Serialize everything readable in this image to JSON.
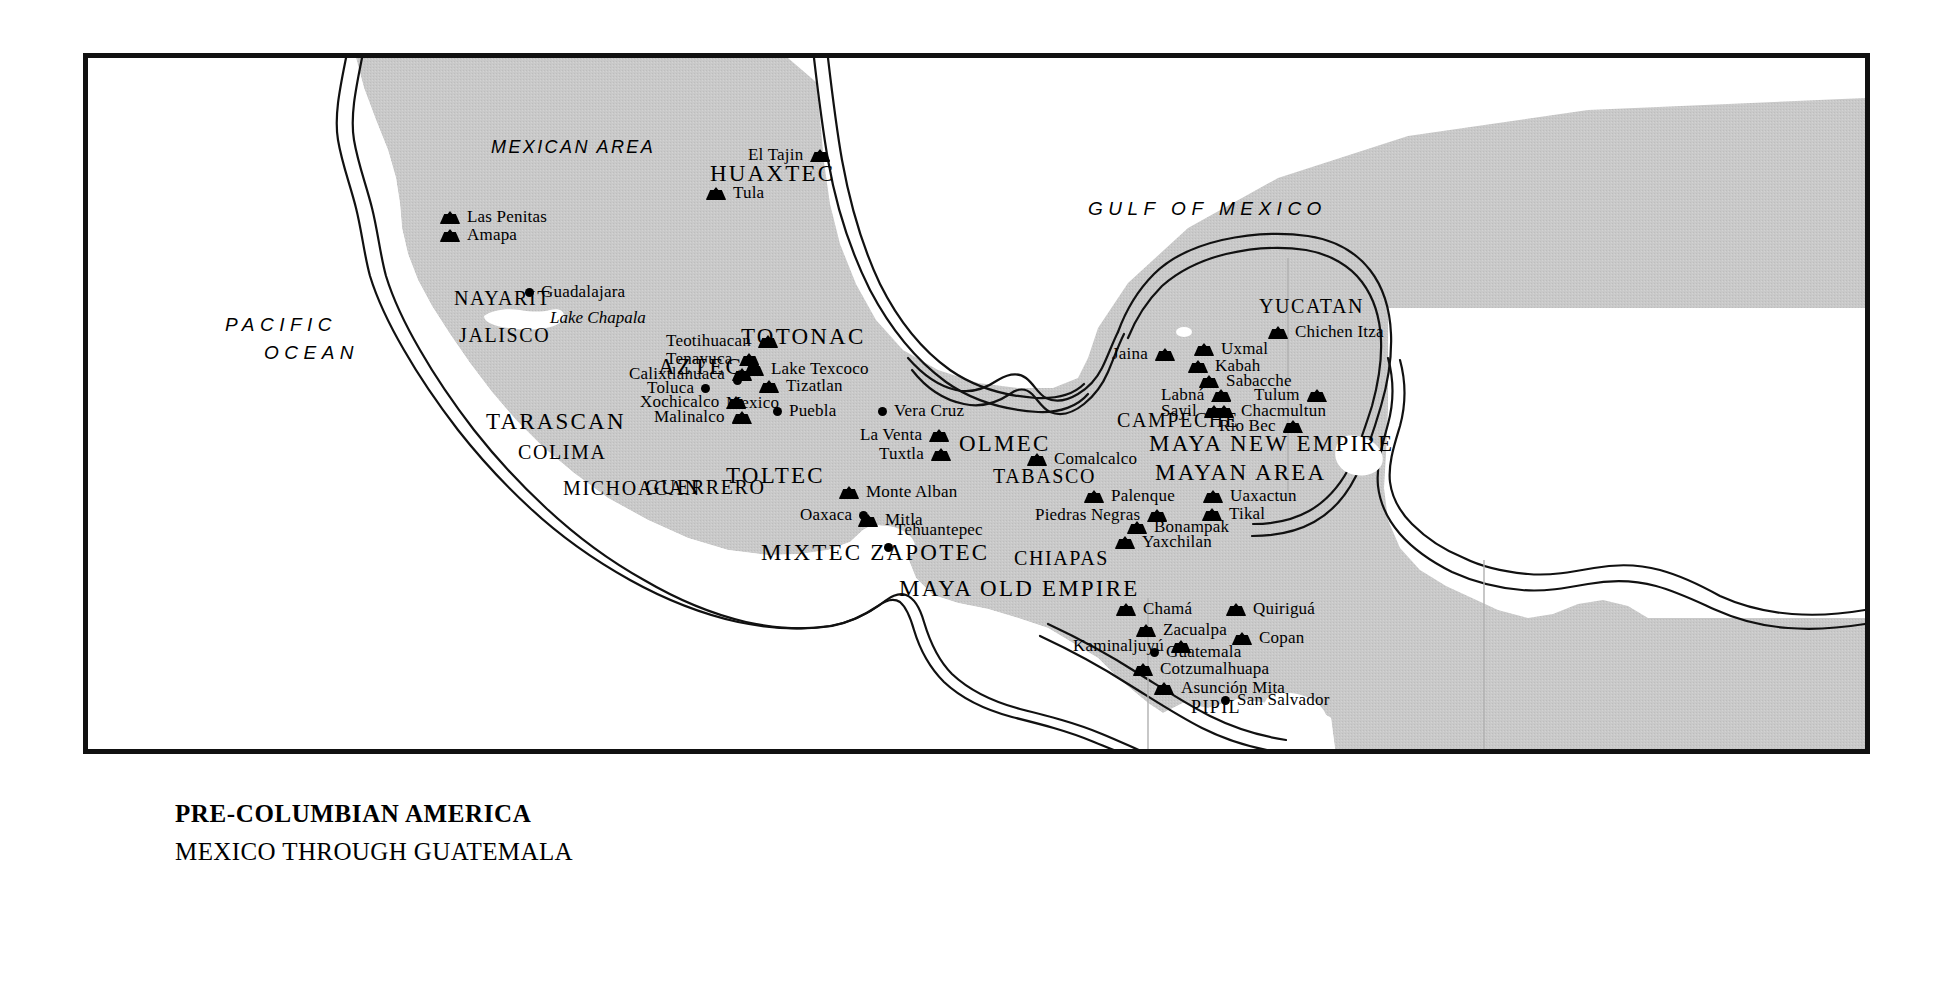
{
  "title": {
    "main": "PRE-COLUMBIAN AMERICA",
    "sub": "MEXICO THROUGH GUATEMALA"
  },
  "colors": {
    "land": "#c9c9c9",
    "water": "#ffffff",
    "ink": "#000000",
    "frame": "#111111"
  },
  "oceans": [
    {
      "name": "PACIFIC",
      "x": 137,
      "y": 257
    },
    {
      "name": "OCEAN",
      "x": 176,
      "y": 285
    },
    {
      "name": "GULF OF MEXICO",
      "x": 1000,
      "y": 141
    }
  ],
  "areas": [
    {
      "name": "MEXICAN AREA",
      "x": 403,
      "y": 80
    }
  ],
  "regions": [
    {
      "name": "HUAXTEC",
      "x": 622,
      "y": 104,
      "size": "lg"
    },
    {
      "name": "NAYARIT",
      "x": 366,
      "y": 230
    },
    {
      "name": "JALISCO",
      "x": 371,
      "y": 267
    },
    {
      "name": "TOTONAC",
      "x": 653,
      "y": 267,
      "size": "lg"
    },
    {
      "name": "AZTEC",
      "x": 570,
      "y": 297,
      "size": "lg"
    },
    {
      "name": "TARASCAN",
      "x": 398,
      "y": 352,
      "size": "lg"
    },
    {
      "name": "COLIMA",
      "x": 430,
      "y": 384
    },
    {
      "name": "TOLTEC",
      "x": 638,
      "y": 406,
      "size": "lg"
    },
    {
      "name": "OLMEC",
      "x": 871,
      "y": 374,
      "size": "lg"
    },
    {
      "name": "MICHOACAN",
      "x": 475,
      "y": 420
    },
    {
      "name": "CAMPECHE",
      "x": 1029,
      "y": 352
    },
    {
      "name": "MAYA NEW EMPIRE",
      "x": 1061,
      "y": 374,
      "size": "lg"
    },
    {
      "name": "YUCATAN",
      "x": 1171,
      "y": 238
    },
    {
      "name": "MAYAN AREA",
      "x": 1067,
      "y": 403,
      "size": "lg"
    },
    {
      "name": "TABASCO",
      "x": 905,
      "y": 408
    },
    {
      "name": "GUERRERO",
      "x": 557,
      "y": 419
    },
    {
      "name": "MIXTEC ZAPOTEC",
      "x": 673,
      "y": 483,
      "size": "lg"
    },
    {
      "name": "CHIAPAS",
      "x": 926,
      "y": 490
    },
    {
      "name": "MAYA OLD EMPIRE",
      "x": 811,
      "y": 519,
      "size": "lg"
    },
    {
      "name": "PIPIL",
      "x": 1103,
      "y": 640
    }
  ],
  "lakes": [
    {
      "name": "Lake Chapala",
      "x": 462,
      "y": 251
    }
  ],
  "sites": [
    {
      "name": "Las Penitas",
      "x": 352,
      "y": 149,
      "marker": "pyramid",
      "side": "right"
    },
    {
      "name": "Amapa",
      "x": 352,
      "y": 167,
      "marker": "pyramid",
      "side": "right"
    },
    {
      "name": "El Tajin",
      "x": 660,
      "y": 87,
      "marker": "pyramid",
      "side": "left"
    },
    {
      "name": "Tula",
      "x": 618,
      "y": 125,
      "marker": "pyramid",
      "side": "right"
    },
    {
      "name": "Guadalajara",
      "x": 437,
      "y": 224,
      "marker": "dot",
      "side": "right"
    },
    {
      "name": "Teotihuacan",
      "x": 578,
      "y": 273,
      "marker": "pyramid",
      "side": "left"
    },
    {
      "name": "Tenayuca",
      "x": 578,
      "y": 291,
      "marker": "pyramid",
      "side": "left"
    },
    {
      "name": "Calixtlahuaca",
      "x": 541,
      "y": 306,
      "marker": "pyramid",
      "side": "left"
    },
    {
      "name": "Lake Texcoco",
      "x": 656,
      "y": 301,
      "marker": "pyramid",
      "side": "right"
    },
    {
      "name": "Toluca",
      "x": 559,
      "y": 320,
      "marker": "dot",
      "side": "left"
    },
    {
      "name": "Tizatlan",
      "x": 671,
      "y": 318,
      "marker": "pyramid",
      "side": "right"
    },
    {
      "name": "Mexico",
      "x": 650,
      "y": 332,
      "marker": "dot-above",
      "side": "none"
    },
    {
      "name": "Xochicalco",
      "x": 552,
      "y": 334,
      "marker": "pyramid",
      "side": "left"
    },
    {
      "name": "Puebla",
      "x": 685,
      "y": 343,
      "marker": "dot",
      "side": "right"
    },
    {
      "name": "Malinalco",
      "x": 566,
      "y": 349,
      "marker": "pyramid",
      "side": "left"
    },
    {
      "name": "Vera Cruz",
      "x": 790,
      "y": 343,
      "marker": "dot",
      "side": "right"
    },
    {
      "name": "La Venta",
      "x": 772,
      "y": 367,
      "marker": "pyramid",
      "side": "left"
    },
    {
      "name": "Tuxtla",
      "x": 791,
      "y": 386,
      "marker": "pyramid",
      "side": "left"
    },
    {
      "name": "Comalcalco",
      "x": 939,
      "y": 391,
      "marker": "pyramid",
      "side": "right"
    },
    {
      "name": "Jaina",
      "x": 1024,
      "y": 286,
      "marker": "pyramid",
      "side": "left"
    },
    {
      "name": "Chichen Itza",
      "x": 1180,
      "y": 264,
      "marker": "pyramid",
      "side": "right"
    },
    {
      "name": "Uxmal",
      "x": 1106,
      "y": 281,
      "marker": "pyramid",
      "side": "right"
    },
    {
      "name": "Kabah",
      "x": 1100,
      "y": 298,
      "marker": "pyramid",
      "side": "right"
    },
    {
      "name": "Sabacche",
      "x": 1111,
      "y": 313,
      "marker": "pyramid",
      "side": "right"
    },
    {
      "name": "Labná",
      "x": 1073,
      "y": 327,
      "marker": "pyramid",
      "side": "left"
    },
    {
      "name": "Tulum",
      "x": 1166,
      "y": 327,
      "marker": "pyramid",
      "side": "left"
    },
    {
      "name": "Sayil",
      "x": 1073,
      "y": 343,
      "marker": "pyramid",
      "side": "left"
    },
    {
      "name": "Chacmultun",
      "x": 1126,
      "y": 343,
      "marker": "pyramid",
      "side": "right"
    },
    {
      "name": "Rio Bec",
      "x": 1131,
      "y": 358,
      "marker": "pyramid",
      "side": "left"
    },
    {
      "name": "Monte Alban",
      "x": 751,
      "y": 424,
      "marker": "pyramid",
      "side": "right"
    },
    {
      "name": "Palenque",
      "x": 996,
      "y": 428,
      "marker": "pyramid",
      "side": "right"
    },
    {
      "name": "Uaxactun",
      "x": 1115,
      "y": 428,
      "marker": "pyramid",
      "side": "right"
    },
    {
      "name": "Oaxaca",
      "x": 712,
      "y": 447,
      "marker": "dot",
      "side": "right"
    },
    {
      "name": "Mitla",
      "x": 770,
      "y": 452,
      "marker": "pyramid",
      "side": "right"
    },
    {
      "name": "Piedras Negras",
      "x": 947,
      "y": 447,
      "marker": "pyramid",
      "side": "left"
    },
    {
      "name": "Tikal",
      "x": 1114,
      "y": 446,
      "marker": "pyramid",
      "side": "right"
    },
    {
      "name": "Bonampak",
      "x": 1039,
      "y": 459,
      "marker": "pyramid",
      "side": "right"
    },
    {
      "name": "Yaxchilan",
      "x": 1027,
      "y": 474,
      "marker": "pyramid",
      "side": "right"
    },
    {
      "name": "Tehuantepec",
      "x": 807,
      "y": 472,
      "marker": "dot-below",
      "side": "none"
    },
    {
      "name": "Chamá",
      "x": 1028,
      "y": 541,
      "marker": "pyramid",
      "side": "right"
    },
    {
      "name": "Quiriguá",
      "x": 1138,
      "y": 541,
      "marker": "pyramid",
      "side": "right"
    },
    {
      "name": "Zacualpa",
      "x": 1048,
      "y": 562,
      "marker": "pyramid",
      "side": "right"
    },
    {
      "name": "Kaminaljuyú",
      "x": 985,
      "y": 578,
      "marker": "pyramid",
      "side": "left"
    },
    {
      "name": "Copan",
      "x": 1144,
      "y": 570,
      "marker": "pyramid",
      "side": "right"
    },
    {
      "name": "Guatemala",
      "x": 1062,
      "y": 584,
      "marker": "dot",
      "side": "right"
    },
    {
      "name": "Cotzumalhuapa",
      "x": 1045,
      "y": 601,
      "marker": "pyramid",
      "side": "right"
    },
    {
      "name": "Asunción Mita",
      "x": 1066,
      "y": 620,
      "marker": "pyramid",
      "side": "right"
    },
    {
      "name": "San Salvador",
      "x": 1133,
      "y": 632,
      "marker": "dot",
      "side": "right"
    }
  ]
}
